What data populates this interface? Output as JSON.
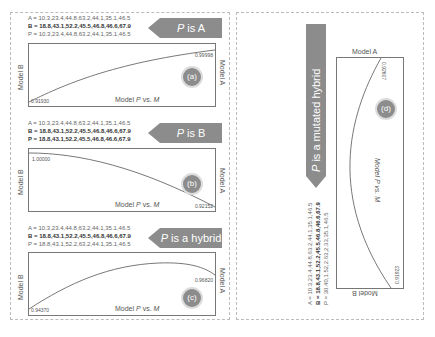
{
  "panels": [
    {
      "id": "a",
      "banner": {
        "prefix": "P",
        "text": " is A"
      },
      "A": "A = 10.3,23.4,44.8,63.2,44.1,35.1,46.5",
      "B": "B = 18.8,43.1,52.2,45.5,46.8,46.6,67.9",
      "P": "P = 10.3,23.4,44.8,63.2,44.1,35.1,46.5",
      "left_value": "0.91930",
      "right_value": "0.99998",
      "xlabel_prefix": "Model ",
      "xlabel_p": "P",
      "xlabel_mid": " vs. ",
      "xlabel_m": "M",
      "ylabel": "Model B",
      "rlabel": "Model A",
      "badge": "(a)"
    },
    {
      "id": "b",
      "banner": {
        "prefix": "P",
        "text": " is B"
      },
      "A": "A = 10.3,23.4,44.8,63.2,44.1,35.1,46.5",
      "B": "B = 18.8,43.1,52.2,45.5,46.8,46.6,67.9",
      "P": "P = 18.8,43.1,52.2,45.5,46.8,46.6,67.9",
      "left_value": "1.00000",
      "right_value": "0.92152",
      "xlabel_prefix": "Model ",
      "xlabel_p": "P",
      "xlabel_mid": " vs. ",
      "xlabel_m": "M",
      "ylabel": "Model B",
      "rlabel": "Model A",
      "badge": "(b)"
    },
    {
      "id": "c",
      "banner": {
        "prefix": "P",
        "text": " is a hybrid"
      },
      "A": "A = 10.3,23.4,44.8,63.2,44.1,35.1,46.5",
      "B": "B = 18.8,43.1,52.2,45.5,46.8,46.6,67.9",
      "P": "P = 18.8,43.1,52.2,63.2,44.1,35.1,46.5",
      "left_value": "0.94370",
      "right_value": "0.96820",
      "xlabel_prefix": "Model ",
      "xlabel_p": "P",
      "xlabel_mid": " vs. ",
      "xlabel_m": "M",
      "ylabel": "Model B",
      "rlabel": "Model A",
      "badge": "(c)"
    },
    {
      "id": "d",
      "banner": {
        "prefix": "P",
        "text": " is a mutated hybrid"
      },
      "A": "A = 10.3,23.4,44.8,63.2,44.1,35.1,46.5",
      "B": "B = 18.8,43.1,52.2,45.5,46.8,46.6,67.9",
      "P": "P = 30.40,1.52,2.63,2.33,35.1,46.5",
      "left_value": "0.91923",
      "right_value": "0.92607",
      "xlabel": "Model P vs. M",
      "top_label": "Model A",
      "bottom_label": "Model B",
      "badge": "(d)"
    }
  ]
}
